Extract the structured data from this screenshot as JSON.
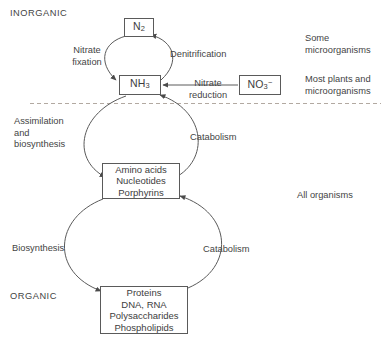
{
  "figure": {
    "type": "nitrogen-cycle-diagram",
    "background_color": "#ffffff",
    "stroke_color": "#5a5a5a",
    "text_color": "#444444",
    "divider_color": "#b0a8a0"
  },
  "regions": {
    "inorganic_label": "INORGANIC",
    "organic_label": "ORGANIC"
  },
  "nodes": {
    "n2": {
      "formula": "N",
      "sub": "2",
      "sup": ""
    },
    "nh3": {
      "formula": "NH",
      "sub": "3",
      "sup": ""
    },
    "no3": {
      "formula": "NO",
      "sub": "3",
      "sup": "−"
    },
    "metabolites": {
      "line1": "Amino acids",
      "line2": "Nucleotides",
      "line3": "Porphyrins"
    },
    "macromolecules": {
      "line1": "Proteins",
      "line2": "DNA, RNA",
      "line3": "Polysaccharides",
      "line4": "Phospholipids"
    }
  },
  "process_labels": {
    "nitrate_fixation": "Nitrate\nfixation",
    "denitrification": "Denitrification",
    "nitrate_reduction": "Nitrate\nreduction",
    "assimilation": "Assimilation\nand\nbiosynthesis",
    "catabolism_upper": "Catabolism",
    "biosynthesis": "Biosynthesis",
    "catabolism_lower": "Catabolism"
  },
  "organism_labels": {
    "some_microorganisms": "Some\nmicroorganisms",
    "most_plants": "Most plants and\nmicroorganisms",
    "all_organisms": "All organisms"
  }
}
